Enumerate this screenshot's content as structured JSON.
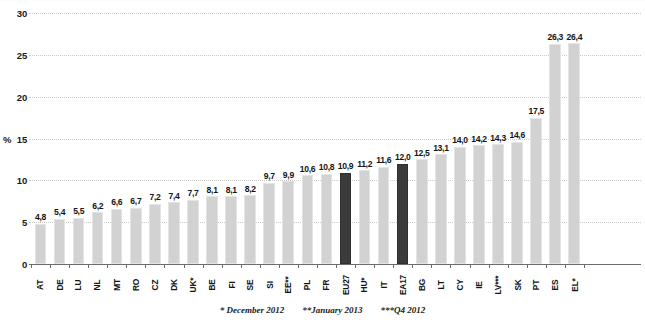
{
  "chart_data": {
    "type": "bar",
    "title": "",
    "subtitle": "",
    "xlabel": "",
    "ylabel": "%",
    "ylim": [
      0,
      30
    ],
    "yticks": [
      0,
      5,
      10,
      15,
      20,
      25,
      30
    ],
    "ytick_labels": [
      "0",
      "5",
      "10",
      "15",
      "20",
      "25",
      "30"
    ],
    "grid": true,
    "legend": "none",
    "decimal_separator": ",",
    "categories": [
      "AT",
      "DE",
      "LU",
      "NL",
      "MT",
      "RO",
      "CZ",
      "DK",
      "UK*",
      "BE",
      "FI",
      "SE",
      "SI",
      "EE**",
      "PL",
      "FR",
      "EU27",
      "HU*",
      "IT",
      "EA17",
      "BG",
      "LT",
      "CY",
      "IE",
      "LV***",
      "SK",
      "PT",
      "ES",
      "EL*"
    ],
    "values": [
      4.8,
      5.4,
      5.5,
      6.2,
      6.6,
      6.7,
      7.2,
      7.4,
      7.7,
      8.1,
      8.1,
      8.2,
      9.7,
      9.9,
      10.6,
      10.8,
      10.9,
      11.2,
      11.6,
      12.0,
      12.5,
      13.1,
      14.0,
      14.2,
      14.3,
      14.6,
      17.5,
      26.3,
      26.4
    ],
    "value_labels": [
      "4,8",
      "5,4",
      "5,5",
      "6,2",
      "6,6",
      "6,7",
      "7,2",
      "7,4",
      "7,7",
      "8,1",
      "8,1",
      "8,2",
      "9,7",
      "9,9",
      "10,6",
      "10,8",
      "10,9",
      "11,2",
      "11,6",
      "12,0",
      "12,5",
      "13,1",
      "14,0",
      "14,2",
      "14,3",
      "14,6",
      "17,5",
      "26,3",
      "26,4"
    ],
    "highlighted": [
      "EU27",
      "EA17"
    ],
    "colors": {
      "bar": "#d2d2d2",
      "bar_highlight": "#3b3b3b",
      "gridline": "#c9c9c9",
      "axis": "#6b6b6b",
      "text": "#151515"
    }
  },
  "footnotes": [
    "* December 2012",
    "**January 2013",
    "***Q4 2012"
  ]
}
